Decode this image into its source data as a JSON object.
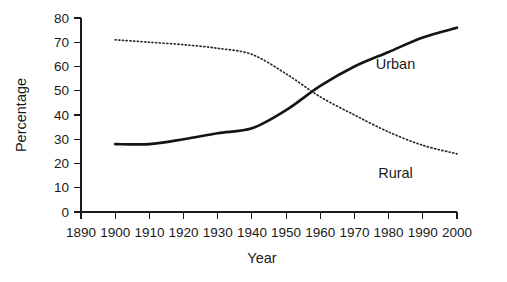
{
  "chart_data": {
    "type": "line",
    "title": "",
    "xlabel": "Year",
    "ylabel": "Percentage",
    "xlim": [
      1890,
      2000
    ],
    "ylim": [
      0,
      80
    ],
    "grid": false,
    "legend_position": "inline-right",
    "x": [
      1900,
      1910,
      1920,
      1930,
      1940,
      1950,
      1960,
      1970,
      1980,
      1990,
      2000
    ],
    "xticks": [
      1890,
      1900,
      1910,
      1920,
      1930,
      1940,
      1950,
      1960,
      1970,
      1980,
      1990,
      2000
    ],
    "xtick_labels": [
      "1890",
      "1900",
      "1910",
      "1920",
      "1930",
      "1940",
      "1950",
      "1960",
      "1970",
      "1980",
      "1990",
      "2000"
    ],
    "yticks": [
      0,
      10,
      20,
      30,
      40,
      50,
      60,
      70,
      80
    ],
    "ytick_labels": [
      "0",
      "10",
      "20",
      "30",
      "40",
      "50",
      "60",
      "70",
      "80"
    ],
    "series": [
      {
        "name": "Urban",
        "style": "solid",
        "color": "#141414",
        "values": [
          28,
          28,
          30,
          32.5,
          34.5,
          42,
          52,
          60,
          66,
          72,
          76
        ]
      },
      {
        "name": "Rural",
        "style": "dotted",
        "color": "#2a2a2a",
        "values": [
          71,
          70,
          69,
          67.5,
          65,
          57,
          47.5,
          40,
          33,
          27.5,
          24
        ]
      }
    ],
    "annotations": [
      {
        "text": "Urban",
        "x": 1982,
        "y": 61
      },
      {
        "text": "Rural",
        "x": 1982,
        "y": 16
      }
    ]
  }
}
